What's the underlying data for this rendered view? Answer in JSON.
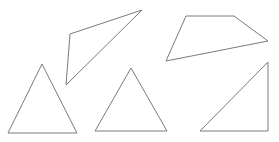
{
  "diagram": {
    "background": "#ffffff",
    "stroke_color": "#7a7a7a",
    "shapes": [
      {
        "name": "skinny-triangle",
        "type": "triangle",
        "points": "70,34 142,10 66,85"
      },
      {
        "name": "quadrilateral",
        "type": "quadrilateral",
        "points": "186,16 234,16 268,41 166,61"
      },
      {
        "name": "isosceles-triangle-left",
        "type": "triangle",
        "points": "42,64 77,133 8,133"
      },
      {
        "name": "isosceles-triangle-middle",
        "type": "triangle",
        "points": "131,68 167,131 95,131"
      },
      {
        "name": "right-triangle",
        "type": "triangle",
        "points": "268,62 268,131 200,131"
      }
    ]
  }
}
